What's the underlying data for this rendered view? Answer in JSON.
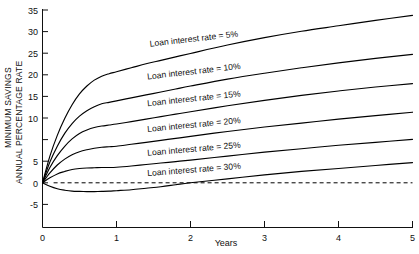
{
  "chart_data": {
    "type": "line",
    "title": "",
    "xlabel": "Years",
    "ylabel": "MINIMUM SAVINGS ANNUAL PERCENTAGE RATE",
    "ylabel_line1": "MINIMUM SAVINGS",
    "ylabel_line2": "ANNUAL PERCENTAGE RATE",
    "xlim": [
      0,
      5
    ],
    "ylim": [
      -7.5,
      35
    ],
    "xticks": [
      0,
      1,
      2,
      3,
      4,
      5
    ],
    "xtick_labels": [
      "0",
      "1",
      "2",
      "3",
      "4",
      "5"
    ],
    "yticks": [
      -5,
      0,
      5,
      10,
      15,
      20,
      25,
      30,
      35
    ],
    "ytick_labels": [
      "-5",
      "0",
      "5",
      "10",
      "15",
      "20",
      "25",
      "30",
      "35"
    ],
    "grid": false,
    "legend_position": "inline-on-curve",
    "annotations": [
      {
        "text": "Loan interest rate = 5%",
        "x": 2.05,
        "y": 28.6,
        "rotation": -6.5
      },
      {
        "text": "Loan interest rate = 10%",
        "x": 2.05,
        "y": 22.0,
        "rotation": -6.5
      },
      {
        "text": "Loan interest rate = 15%",
        "x": 2.05,
        "y": 16.5,
        "rotation": -6.0
      },
      {
        "text": "Loan interest rate = 20%",
        "x": 2.05,
        "y": 11.2,
        "rotation": -5.5
      },
      {
        "text": "Loan interest rate = 25%",
        "x": 2.05,
        "y": 6.3,
        "rotation": -5.0
      },
      {
        "text": "Loan interest rate = 30%",
        "x": 2.05,
        "y": 2.1,
        "rotation": -4.5
      }
    ],
    "reference_lines": [
      {
        "type": "horizontal",
        "y": 0,
        "style": "dashed",
        "x_from": 0.15,
        "x_to": 5.0
      }
    ],
    "x": [
      0,
      0.1,
      0.2,
      0.3,
      0.4,
      0.5,
      0.6,
      0.7,
      0.8,
      0.9,
      1.0,
      1.2,
      1.4,
      1.6,
      1.8,
      2.0,
      2.5,
      3.0,
      3.5,
      4.0,
      4.5,
      5.0
    ],
    "series": [
      {
        "name": "Loan interest rate = 5%",
        "values": [
          0,
          5.4,
          9.6,
          13.0,
          15.8,
          18.0,
          19.6,
          20.8,
          21.6,
          22.1,
          22.5,
          23.3,
          24.1,
          24.8,
          25.5,
          26.2,
          27.9,
          29.4,
          30.7,
          31.8,
          32.9,
          33.9
        ]
      },
      {
        "name": "Loan interest rate = 10%",
        "values": [
          0,
          4.2,
          7.4,
          10.0,
          12.0,
          13.5,
          14.6,
          15.4,
          16.0,
          16.3,
          16.6,
          17.2,
          17.8,
          18.4,
          19.0,
          19.6,
          21.0,
          22.2,
          23.3,
          24.3,
          25.2,
          26.0
        ]
      },
      {
        "name": "Loan interest rate = 15%",
        "values": [
          0,
          3.1,
          5.5,
          7.4,
          8.9,
          10.0,
          10.7,
          11.2,
          11.5,
          11.7,
          11.9,
          12.4,
          12.9,
          13.4,
          13.9,
          14.4,
          15.6,
          16.7,
          17.7,
          18.6,
          19.4,
          20.1
        ]
      },
      {
        "name": "Loan interest rate = 20%",
        "values": [
          0,
          2.0,
          3.6,
          4.8,
          5.7,
          6.3,
          6.7,
          7.0,
          7.2,
          7.3,
          7.4,
          7.8,
          8.2,
          8.6,
          9.0,
          9.4,
          10.4,
          11.3,
          12.1,
          12.9,
          13.6,
          14.3
        ]
      },
      {
        "name": "Loan interest rate = 25%",
        "values": [
          0,
          1.0,
          1.8,
          2.3,
          2.7,
          2.9,
          3.0,
          3.05,
          3.1,
          3.1,
          3.15,
          3.4,
          3.7,
          4.0,
          4.3,
          4.6,
          5.4,
          6.2,
          6.9,
          7.6,
          8.2,
          8.8
        ]
      },
      {
        "name": "Loan interest rate = 30%",
        "values": [
          0,
          -0.7,
          -1.2,
          -1.5,
          -1.7,
          -1.75,
          -1.78,
          -1.78,
          -1.75,
          -1.7,
          -1.6,
          -1.4,
          -1.1,
          -0.8,
          -0.4,
          0.0,
          0.8,
          1.6,
          2.3,
          2.9,
          3.5,
          4.1
        ]
      }
    ]
  }
}
